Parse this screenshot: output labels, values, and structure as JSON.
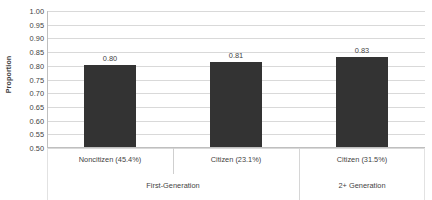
{
  "chart_data": {
    "type": "bar",
    "title": "",
    "subtitle": "",
    "xlabel": "",
    "ylabel": "Proportion",
    "ylim": [
      0.5,
      1.0
    ],
    "ytick_step": 0.05,
    "ytick_labels": [
      "1.00",
      "0.95",
      "0.90",
      "0.85",
      "0.80",
      "0.75",
      "0.70",
      "0.65",
      "0.60",
      "0.55",
      "0.50"
    ],
    "ytick_values": [
      1.0,
      0.95,
      0.9,
      0.85,
      0.8,
      0.75,
      0.7,
      0.65,
      0.6,
      0.55,
      0.5
    ],
    "grid": true,
    "grid_axis": "y",
    "legend": false,
    "legend_position": "none",
    "categories": [
      "Noncitizen (45.4%)",
      "Citizen (23.1%)",
      "Citizen (31.5%)"
    ],
    "values": [
      0.8,
      0.81,
      0.83
    ],
    "data_labels": [
      "0.80",
      "0.81",
      "0.83"
    ],
    "bar_color": "#333333",
    "groups": [
      {
        "label": "First-Generation",
        "category_indices": [
          0,
          1
        ]
      },
      {
        "label": "2+ Generation",
        "category_indices": [
          2
        ]
      }
    ],
    "colors": {
      "bar": "#333333",
      "gridline": "#d9d9d9",
      "axis": "#bfbfbf",
      "text": "#3f3f3f",
      "background": "#ffffff"
    }
  }
}
